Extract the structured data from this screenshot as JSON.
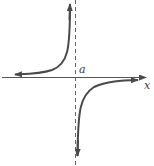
{
  "diagram": {
    "type": "function-graph",
    "labels": {
      "asymptote": "a",
      "x_axis": "x"
    },
    "colors": {
      "curve": "#4a4a4a",
      "axis": "#555555",
      "asymptote": "#666666",
      "background": "#ffffff"
    },
    "elements": [
      {
        "name": "x-axis",
        "style": "solid",
        "arrow": "right"
      },
      {
        "name": "vertical-asymptote",
        "at": "a",
        "style": "dashed"
      },
      {
        "name": "upper-left-branch",
        "quadrant": "left of a, above x-axis",
        "arrows": [
          "left",
          "up"
        ]
      },
      {
        "name": "lower-right-branch",
        "quadrant": "right of a, below x-axis",
        "arrows": [
          "down",
          "right"
        ]
      }
    ]
  }
}
